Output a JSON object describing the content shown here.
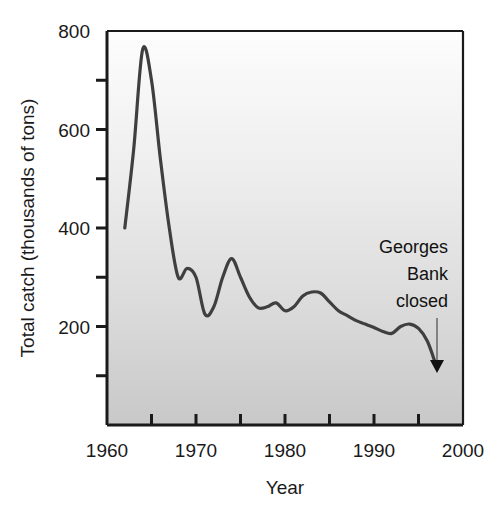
{
  "chart_data": {
    "type": "line",
    "title": "",
    "subtitle": "",
    "xlabel": "Year",
    "ylabel": "Total catch (thousands of tons)",
    "xlim": [
      1960,
      2000
    ],
    "ylim": [
      0,
      800
    ],
    "grid": false,
    "legend": "none",
    "x_ticks_major": [
      1960,
      1970,
      1980,
      1990,
      2000
    ],
    "x_ticks_minor": [
      1965,
      1975,
      1985,
      1995
    ],
    "x_tick_labels": [
      "1960",
      "1970",
      "1980",
      "1990",
      "2000"
    ],
    "y_ticks_major": [
      200,
      400,
      600,
      800
    ],
    "y_ticks_minor": [
      100,
      300,
      500,
      700
    ],
    "y_tick_labels": [
      "200",
      "400",
      "600",
      "800"
    ],
    "series": [
      {
        "name": "Total catch",
        "color": "#3f3f3f",
        "x": [
          1962,
          1963,
          1964,
          1965,
          1966,
          1967,
          1968,
          1969,
          1970,
          1971,
          1972,
          1973,
          1974,
          1975,
          1976,
          1977,
          1978,
          1979,
          1980,
          1981,
          1982,
          1983,
          1984,
          1985,
          1986,
          1987,
          1988,
          1989,
          1990,
          1991,
          1992,
          1993,
          1994,
          1995,
          1996,
          1997
        ],
        "values": [
          400,
          560,
          762,
          700,
          540,
          400,
          300,
          318,
          300,
          225,
          240,
          300,
          338,
          300,
          260,
          238,
          240,
          248,
          232,
          240,
          262,
          270,
          268,
          250,
          232,
          222,
          212,
          205,
          198,
          190,
          186,
          200,
          205,
          196,
          170,
          120
        ]
      }
    ],
    "annotations": [
      {
        "name": "georges-bank-closed",
        "lines": [
          "Georges",
          "Bank",
          "closed"
        ],
        "text_x": 1996.2,
        "text_y": 430,
        "arrow_x": 1997.0,
        "arrow_from_y": 360,
        "arrow_to_y": 175,
        "color": "#111111"
      }
    ],
    "plot_background": {
      "type": "linear-gradient-vertical",
      "top_color": "#fcfcfc",
      "bottom_color": "#c9c9c9"
    },
    "axis_color": "#1a1a1a",
    "line_width": 3.2
  },
  "axis": {
    "ylabel": "Total catch (thousands of tons)",
    "xlabel": "Year"
  },
  "x_labels": {
    "t0": "1960",
    "t1": "1970",
    "t2": "1980",
    "t3": "1990",
    "t4": "2000"
  },
  "y_labels": {
    "t0": "200",
    "t1": "400",
    "t2": "600",
    "t3": "800"
  },
  "annotation": {
    "line1": "Georges",
    "line2": "Bank",
    "line3": "closed"
  }
}
